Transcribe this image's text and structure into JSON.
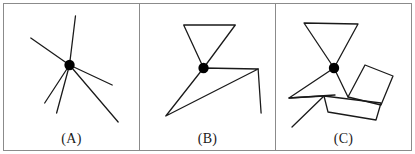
{
  "figure": {
    "caption_style": "parenthesized-letters",
    "background_color": "#ffffff",
    "stroke_color": "#1a1a1a",
    "border_color": "#8b8b8b",
    "junction_dot_color": "#000000",
    "width": 415,
    "height": 154
  },
  "panels": [
    {
      "id": "panel-a",
      "label": "(A)",
      "description": "single junction point with six radiating straight line segments",
      "junction": {
        "x": 70,
        "y": 63,
        "r": 5.2
      },
      "segments": [
        {
          "name": "ray-up",
          "x1": 70,
          "y1": 63,
          "x2": 76,
          "y2": 14
        },
        {
          "name": "ray-upper-left",
          "x1": 70,
          "y1": 63,
          "x2": 31,
          "y2": 36
        },
        {
          "name": "ray-right",
          "x1": 70,
          "y1": 63,
          "x2": 113,
          "y2": 83
        },
        {
          "name": "ray-lower-right",
          "x1": 70,
          "y1": 63,
          "x2": 119,
          "y2": 120
        },
        {
          "name": "ray-lower-left",
          "x1": 70,
          "y1": 63,
          "x2": 45,
          "y2": 101
        },
        {
          "name": "ray-down",
          "x1": 70,
          "y1": 63,
          "x2": 57,
          "y2": 111
        }
      ],
      "dots": [],
      "polylines": []
    },
    {
      "id": "panel-b",
      "label": "(B)",
      "description": "downward triangle meeting a thin elongated triangle at one junction, with a crossing line",
      "junction": {
        "x": 201,
        "y": 66,
        "r": 5.2
      },
      "segments": [],
      "polylines": [
        {
          "name": "upper-triangle",
          "points": "201,66 181,23 233,23 201,66",
          "closed": true
        },
        {
          "name": "lower-thin-triangle",
          "points": "201,66 256,67 163,114 201,66",
          "closed": true
        },
        {
          "name": "crossing-line",
          "points": "256,67 259,111",
          "closed": false
        }
      ],
      "dots": []
    },
    {
      "id": "panel-c",
      "label": "(C)",
      "description": "downward triangle, left wedge, tilted quadrilateral and lower quadrilateral joined at a junction",
      "junction": {
        "x": 336,
        "y": 66,
        "r": 5.2
      },
      "segments": [],
      "polylines": [
        {
          "name": "upper-triangle",
          "points": "336,66 306,21 360,22 336,66",
          "closed": true
        },
        {
          "name": "left-wedge",
          "points": "336,66 291,96 337,93 336,66",
          "closed": true
        },
        {
          "name": "junction-to-notch",
          "points": "336,66 350,95",
          "closed": false
        },
        {
          "name": "tilted-quad",
          "points": "350,95 367,63 395,74 383,103 350,95",
          "closed": true
        },
        {
          "name": "lower-quad",
          "points": "326,94 383,101 378,118 330,110 326,94",
          "closed": true
        },
        {
          "name": "baseline-left",
          "points": "326,94 291,96",
          "closed": false
        },
        {
          "name": "tail-lower-left",
          "points": "326,94 294,125",
          "closed": false
        },
        {
          "name": "quad-right-edge",
          "points": "383,101 383,103",
          "closed": false
        }
      ],
      "dots": []
    }
  ]
}
